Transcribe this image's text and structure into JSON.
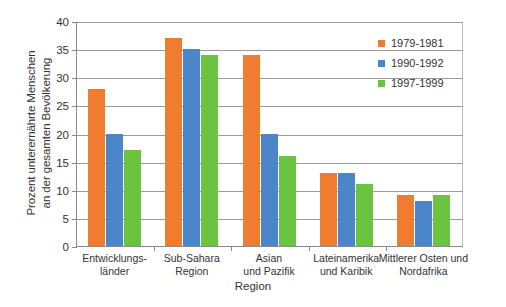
{
  "chart_data": {
    "type": "bar",
    "title": "",
    "xlabel": "Region",
    "ylabel": "Prozent unterernährte Menschen\nan der gesamten Bevölkerung",
    "ylim": [
      0,
      40
    ],
    "yticks": [
      0,
      5,
      10,
      15,
      20,
      25,
      30,
      35,
      40
    ],
    "ytick_labels": [
      "0",
      "5",
      "10",
      "15",
      "20",
      "25",
      "30",
      "35",
      "40"
    ],
    "grid": true,
    "legend_position": "top-right",
    "categories": [
      "Entwicklungs-\nländer",
      "Sub-Sahara\nRegion",
      "Asian\nund Pazifik",
      "Lateinamerika\nund Karibik",
      "Mittlerer Osten und\nNordafrika"
    ],
    "series": [
      {
        "name": "1979-1981",
        "color": "#f07d2f",
        "values": [
          28,
          37,
          34,
          13,
          9
        ]
      },
      {
        "name": "1990-1992",
        "color": "#4a86c8",
        "values": [
          20,
          35,
          20,
          13,
          8
        ]
      },
      {
        "name": "1997-1999",
        "color": "#6cc33f",
        "values": [
          17,
          34,
          16,
          11,
          9
        ]
      }
    ]
  },
  "colors": {
    "series_1979": "#f07d2f",
    "series_1990": "#4a86c8",
    "series_1997": "#6cc33f",
    "axis": "#8a8a8a",
    "grid": "#9c9c9c",
    "text": "#333333",
    "background": "#ffffff"
  }
}
